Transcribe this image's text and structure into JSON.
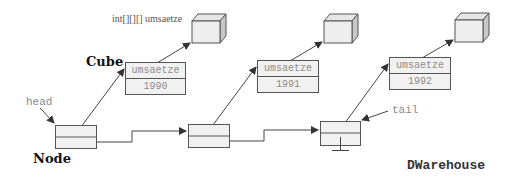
{
  "labels": {
    "array_label": "int[][][] umsaetze",
    "cube_label": "Cube",
    "node_label": "Node",
    "head_label": "head",
    "tail_label": "tail",
    "class_label": "DWarehouse"
  },
  "cubes": [
    {
      "field": "umsaetze",
      "year": "1990"
    },
    {
      "field": "umsaetze",
      "year": "1991"
    },
    {
      "field": "umsaetze",
      "year": "1992"
    }
  ],
  "colors": {
    "line": "#444444",
    "fill": "#f1f1f1",
    "text_grey": "#8a8a8a"
  }
}
